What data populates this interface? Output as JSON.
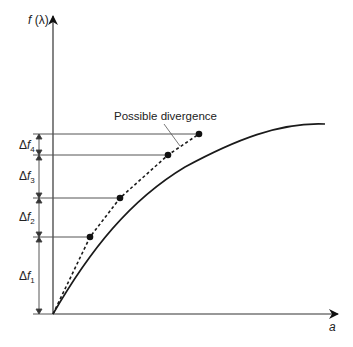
{
  "diagram": {
    "y_axis_label": "f (λ)",
    "x_axis_label": "a",
    "annotation": "Possible divergence",
    "increments": [
      {
        "delta": "Δ",
        "f": "f",
        "sub": "4"
      },
      {
        "delta": "Δ",
        "f": "f",
        "sub": "3"
      },
      {
        "delta": "Δ",
        "f": "f",
        "sub": "2"
      },
      {
        "delta": "Δ",
        "f": "f",
        "sub": "1"
      }
    ],
    "colors": {
      "curve": "#1a1a1a",
      "guide_lines": "#555555",
      "points": "#111111"
    }
  }
}
